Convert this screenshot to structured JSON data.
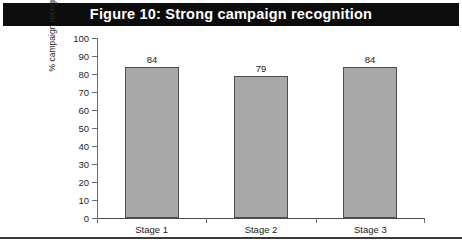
{
  "figure": {
    "title": "Figure 10: Strong campaign recognition",
    "banner_color": "#0c0c0c",
    "banner_text_color": "#ffffff",
    "background_color": "#ffffff",
    "rule_color": "#3a3a3a"
  },
  "chart_data": {
    "type": "bar",
    "title": "Figure 10: Strong campaign recognition",
    "categories": [
      "Stage 1",
      "Stage 2",
      "Stage 3"
    ],
    "values": [
      84,
      79,
      84
    ],
    "data_labels": [
      "84",
      "79",
      "84"
    ],
    "xlabel": "",
    "ylabel": "% campaign recognition",
    "ylim": [
      0,
      100
    ],
    "ytick_step": 10,
    "yticks": [
      0,
      10,
      20,
      30,
      40,
      50,
      60,
      70,
      80,
      90,
      100
    ],
    "ytick_labels": [
      "0",
      "10",
      "20",
      "30",
      "40",
      "50",
      "60",
      "70",
      "80",
      "90",
      "100"
    ],
    "grid": false,
    "legend": false,
    "legend_position": "none",
    "bar_fill_color": "#a9a9a9",
    "bar_border_color": "#4d4d4d",
    "axis_color": "#6e6e6e",
    "series": [
      {
        "name": "% campaign recognition",
        "values": [
          84,
          79,
          84
        ]
      }
    ]
  }
}
